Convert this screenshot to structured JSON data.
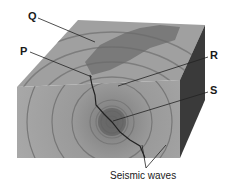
{
  "diagram": {
    "labels": {
      "Q": "Q",
      "P": "P",
      "R": "R",
      "S": "S"
    },
    "caption": "Seismic waves",
    "colors": {
      "top_face": "#9a9a9a",
      "front_face": "#8a8a8a",
      "side_face": "#3a3a3a",
      "fault": "#222222",
      "wave_rings": "#6a6a6a"
    }
  }
}
